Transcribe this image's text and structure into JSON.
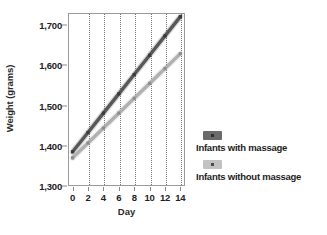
{
  "chart_data": {
    "type": "line",
    "title": "",
    "xlabel": "Day",
    "ylabel": "Weight (grams)",
    "x": [
      0,
      2,
      4,
      6,
      8,
      10,
      12,
      14
    ],
    "xlim": [
      -0.6,
      14.6
    ],
    "ylim": [
      1300,
      1730
    ],
    "xticks": [
      "0",
      "2",
      "4",
      "6",
      "8",
      "10",
      "12",
      "14"
    ],
    "yticks": [
      "1,300",
      "1,400",
      "1,500",
      "1,600",
      "1,700"
    ],
    "ytick_values": [
      1300,
      1400,
      1500,
      1600,
      1700
    ],
    "grid": "vertical-dotted",
    "legend_position": "right",
    "series": [
      {
        "name": "Infants with massage",
        "color": "#585858",
        "values": [
          1385,
          1433,
          1481,
          1529,
          1577,
          1625,
          1673,
          1721
        ]
      },
      {
        "name": "Infants without massage",
        "color": "#b0b0b0",
        "values": [
          1370,
          1407,
          1444,
          1481,
          1518,
          1555,
          1592,
          1629
        ]
      }
    ]
  },
  "legend": {
    "entries": [
      {
        "label": "Infants with massage",
        "swatch_color": "#6b6b6b",
        "dot_color": "#303030"
      },
      {
        "label": "Infants without massage",
        "swatch_color": "#c2c2c2",
        "dot_color": "#4a4a4a"
      }
    ]
  },
  "colors": {
    "background": "#ffffff",
    "axis": "#9b9b9b",
    "gridline": "#767676",
    "text": "#222222"
  }
}
